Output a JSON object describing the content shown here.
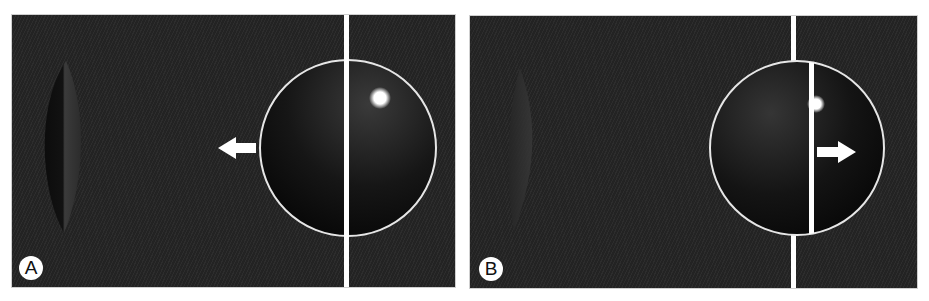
{
  "figure": {
    "panels": [
      {
        "id": "A",
        "label": "A",
        "arrow_direction": "left",
        "description": "Lens on left; circle with vertical line through its center; glow spot upper right inside circle"
      },
      {
        "id": "B",
        "label": "B",
        "arrow_direction": "right",
        "description": "Faint lens on left; circle with vertical line displaced right inside circle; glow spot at the displaced line"
      }
    ],
    "colors": {
      "background": "#252525",
      "lines": "#ffffff",
      "circle_stroke": "#e6e6e6",
      "page": "#ffffff"
    }
  }
}
